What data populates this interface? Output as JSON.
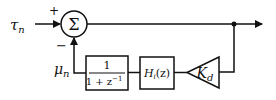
{
  "diagram": {
    "input_label": "τ",
    "input_sub": "n",
    "feedback_label": "μ",
    "feedback_sub": "n",
    "plus_sign": "+",
    "minus_sign": "−",
    "sum_symbol": "Σ",
    "blocks": [
      {
        "id": "integrator",
        "numerator": "1",
        "denominator": "1 + z",
        "denominator_exp": "−1"
      },
      {
        "id": "filter",
        "label": "H",
        "sub": "i",
        "arg": "(z)"
      },
      {
        "id": "gain",
        "label": "K",
        "sub": "d"
      }
    ],
    "colors": {
      "stroke": "#111111",
      "background": "#ffffff"
    }
  }
}
